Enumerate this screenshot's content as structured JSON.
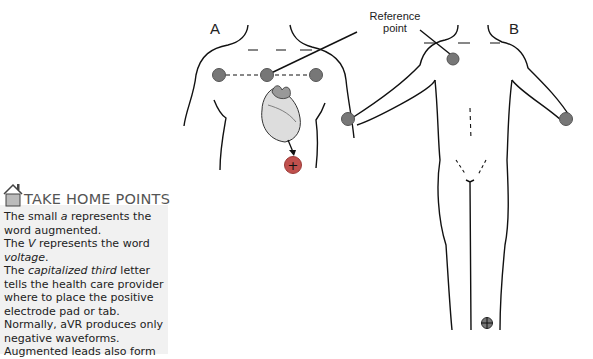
{
  "figure": {
    "panel_a_label": "A",
    "panel_b_label": "B",
    "callout": {
      "line1": "Reference",
      "line2": "point"
    },
    "positive_symbol": "+",
    "electrode_color": "#777777",
    "positive_electrode_color": "#c0504d"
  },
  "take_home": {
    "icon": "house-icon",
    "title": "TAKE HOME POINTS",
    "points": [
      {
        "pre": "The small ",
        "em": "a",
        "post": " represents the word augmented."
      },
      {
        "pre": "The ",
        "em": "V",
        "post": " represents the word ",
        "em2": "voltage",
        "post2": "."
      },
      {
        "pre": "The ",
        "em": "capitalized third",
        "post": " letter tells the health care provider where to place the positive electrode pad or tab."
      },
      {
        "pre": "Normally, aVR produces only negative waveforms.",
        "em": "",
        "post": ""
      },
      {
        "pre": "Augmented leads also form",
        "em": "",
        "post": ""
      }
    ],
    "background": "#f1f1f1"
  }
}
